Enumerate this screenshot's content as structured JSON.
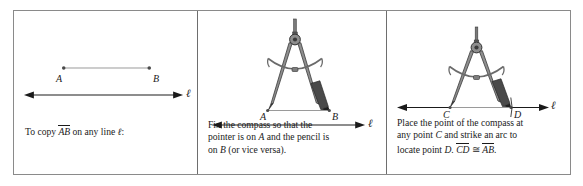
{
  "figure": {
    "panels": [
      {
        "id": "panel-1",
        "caption_lines": [
          "To copy ",
          "AB",
          " on any line ",
          "ℓ",
          ":"
        ],
        "caption_prefix": "To copy ",
        "caption_overline": "AB",
        "caption_middle": " on any line ",
        "caption_line_label": "ℓ",
        "caption_suffix": ":",
        "point_labels": [
          "A",
          "B"
        ],
        "line_label": "ℓ",
        "segment": {
          "from": "A",
          "to": "B"
        }
      },
      {
        "id": "panel-2",
        "caption_lines": [
          "Fix the compass so that the",
          "pointer is on A and the pencil is",
          "on B (or vice versa)."
        ],
        "caption_l1_a": "Fix the compass so that the",
        "caption_l2_a": "pointer is on ",
        "caption_l2_it": "A",
        "caption_l2_b": " and the pencil is",
        "caption_l3_a": "on ",
        "caption_l3_it": "B",
        "caption_l3_b": " (or vice versa).",
        "point_labels": [
          "A",
          "B"
        ],
        "line_label": "ℓ"
      },
      {
        "id": "panel-3",
        "caption_lines": [
          "Place the point of the compass at",
          "any point C and strike an arc to",
          "locate point D. CD ≅ AB."
        ],
        "caption_l1": "Place the point of the compass at",
        "caption_l2_a": "any point ",
        "caption_l2_it": "C",
        "caption_l2_b": " and strike an arc to",
        "caption_l3_a": "locate point ",
        "caption_l3_it": "D",
        "caption_l3_dot": ". ",
        "caption_l3_ov1": "CD",
        "caption_l3_cong": " ≅ ",
        "caption_l3_ov2": "AB",
        "caption_l3_end": ".",
        "point_labels": [
          "C",
          "D"
        ],
        "line_label": "ℓ"
      }
    ]
  },
  "colors": {
    "frame": "#8a8a8a",
    "divider": "#6e6e6e",
    "ink": "#1a1a1a",
    "segment": "#9a9a9a",
    "compass_metal": "#6b6b6b",
    "compass_dark": "#2f2f2f",
    "pencil_lead": "#3a3a3a"
  }
}
